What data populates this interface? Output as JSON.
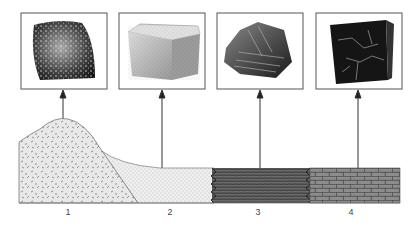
{
  "figure": {
    "type": "rock-formation-diagram",
    "rocks": [
      {
        "id": 1,
        "label": "1",
        "sample": "granite (igneous, speckled)",
        "layer_pattern": "dashes"
      },
      {
        "id": 2,
        "label": "2",
        "sample": "sandstone (sedimentary, grainy block)",
        "layer_pattern": "fine-dots"
      },
      {
        "id": 3,
        "label": "3",
        "sample": "shale (layered, flaky)",
        "layer_pattern": "horizontal-lines"
      },
      {
        "id": 4,
        "label": "4",
        "sample": "limestone/marble (dark block with veins)",
        "layer_pattern": "bricks"
      }
    ],
    "colors": {
      "box_border": "#555555",
      "arrow": "#333333",
      "granite_fill": "#e6e6e6",
      "sand_fill": "#ebebeb",
      "shale_fill": "#555555",
      "brick_fill": "#8a8a8a"
    }
  }
}
